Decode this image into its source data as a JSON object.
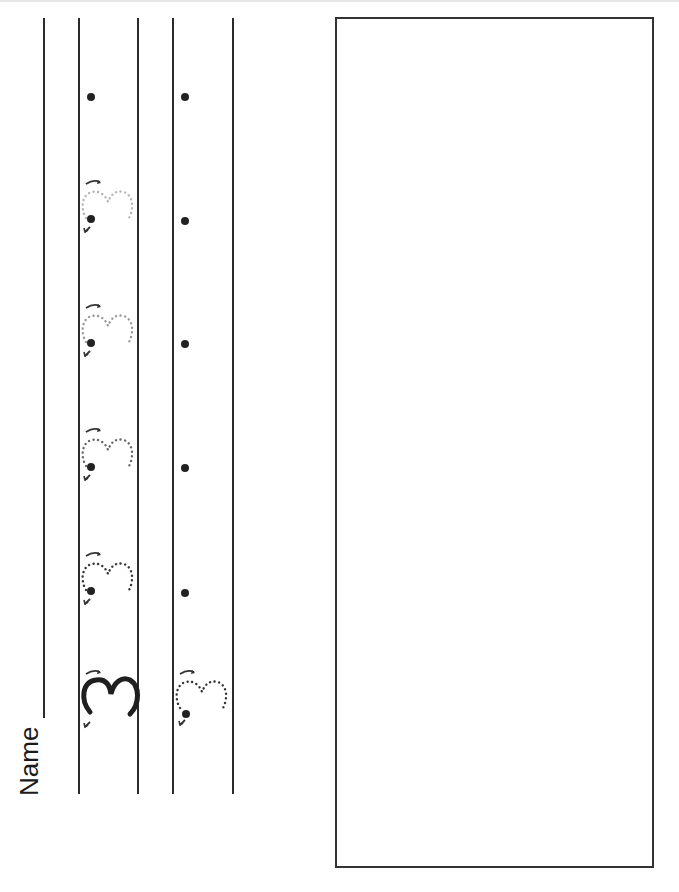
{
  "worksheet": {
    "name_label": "Name",
    "digit": "3",
    "orientation": "rotated 90deg counter-clockwise",
    "row1": {
      "model_digit": "3",
      "traces": [
        "dotted-3-dark",
        "dotted-3-dark",
        "dotted-3-medium",
        "dotted-3-light",
        "dotted-3-lightest"
      ],
      "start_dots": 5
    },
    "row2": {
      "traces": [
        "dotted-3-dark"
      ],
      "start_dots": 5
    },
    "drawing_box": {
      "label": ""
    },
    "colors": {
      "ink": "#222222",
      "line": "#2b2b2b",
      "dotted_dark": "#333333",
      "dotted_medium": "#777777",
      "dotted_light": "#999999",
      "dotted_lightest": "#b5b5b5"
    }
  }
}
